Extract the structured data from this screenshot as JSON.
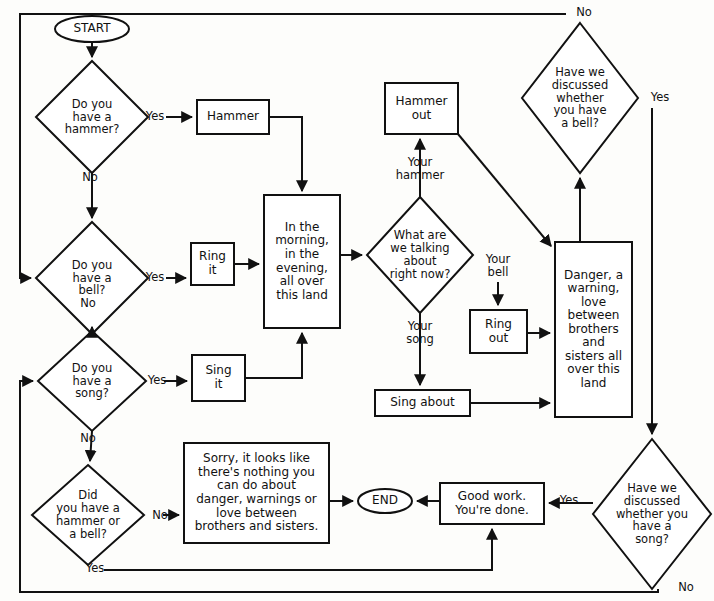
{
  "diagram": {
    "style": {
      "stroke": "#111111",
      "fill": "#ffffff",
      "background": "#fdfdfb",
      "stroke_width": 2
    },
    "nodes": [
      {
        "id": "start",
        "shape": "terminator",
        "text": "START",
        "cx": 92,
        "cy": 29,
        "w": 74,
        "h": 26,
        "font": "n-term"
      },
      {
        "id": "q-hammer",
        "shape": "decision",
        "text": "Do you\nhave a\nhammer?",
        "cx": 92,
        "cy": 117,
        "w": 112,
        "h": 112,
        "font": "n-dec"
      },
      {
        "id": "q-bell",
        "shape": "decision",
        "text": "Do you\nhave a\nbell?",
        "cx": 92,
        "cy": 278,
        "w": 112,
        "h": 112,
        "font": "n-dec"
      },
      {
        "id": "q-song",
        "shape": "decision",
        "text": "Do you\nhave a\nsong?",
        "cx": 92,
        "cy": 381,
        "w": 108,
        "h": 100,
        "font": "n-dec"
      },
      {
        "id": "q-had-hammer-bell",
        "shape": "decision",
        "text": "Did\nyou have a\nhammer or\na bell?",
        "cx": 88,
        "cy": 515,
        "w": 112,
        "h": 100,
        "font": "n-dec"
      },
      {
        "id": "p-hammer",
        "shape": "process",
        "text": "Hammer",
        "x": 197,
        "y": 100,
        "w": 72,
        "h": 34,
        "font": "n-proc"
      },
      {
        "id": "p-ring-it",
        "shape": "process",
        "text": "Ring\nit",
        "x": 191,
        "y": 243,
        "w": 43,
        "h": 42,
        "font": "n-proc"
      },
      {
        "id": "p-sing-it",
        "shape": "process",
        "text": "Sing\nit",
        "x": 192,
        "y": 355,
        "w": 53,
        "h": 46,
        "font": "n-proc"
      },
      {
        "id": "p-morning",
        "shape": "process",
        "text": "In the\nmorning,\nin the\nevening,\nall over\nthis land",
        "x": 264,
        "y": 195,
        "w": 76,
        "h": 133,
        "font": "n-proc"
      },
      {
        "id": "p-hammer-out",
        "shape": "process",
        "text": "Hammer\nout",
        "x": 385,
        "y": 83,
        "w": 73,
        "h": 51,
        "font": "n-proc"
      },
      {
        "id": "q-talking",
        "shape": "decision",
        "text": "What are\nwe talking\nabout\nright now?",
        "cx": 420,
        "cy": 255,
        "w": 106,
        "h": 116,
        "font": "n-dec"
      },
      {
        "id": "p-ring-out",
        "shape": "process",
        "text": "Ring\nout",
        "x": 470,
        "y": 310,
        "w": 57,
        "h": 43,
        "font": "n-proc"
      },
      {
        "id": "p-sing-about",
        "shape": "process",
        "text": "Sing about",
        "x": 375,
        "y": 390,
        "w": 95,
        "h": 26,
        "font": "n-proc"
      },
      {
        "id": "p-danger",
        "shape": "process",
        "text": "Danger, a\nwarning,\nlove\nbetween\nbrothers\nand\nsisters all\nover this\nland",
        "x": 555,
        "y": 242,
        "w": 77,
        "h": 175,
        "font": "n-proc"
      },
      {
        "id": "q-disc-bell",
        "shape": "decision",
        "text": "Have we\ndiscussed\nwhether\nyou have\na bell?",
        "cx": 580,
        "cy": 98,
        "w": 116,
        "h": 150,
        "font": "n-dec"
      },
      {
        "id": "q-disc-song",
        "shape": "decision",
        "text": "Have we\ndiscussed\nwhether you\nhave a\nsong?",
        "cx": 652,
        "cy": 514,
        "w": 118,
        "h": 150,
        "font": "n-dec"
      },
      {
        "id": "p-sorry",
        "shape": "process",
        "text": "Sorry, it looks like\nthere's nothing you\ncan do about\ndanger, warnings or\nlove between\nbrothers and sisters.",
        "x": 184,
        "y": 443,
        "w": 145,
        "h": 100,
        "font": "n-proc"
      },
      {
        "id": "p-good-work",
        "shape": "process",
        "text": "Good work.\nYou're done.",
        "x": 440,
        "y": 483,
        "w": 104,
        "h": 41,
        "font": "n-proc"
      },
      {
        "id": "end",
        "shape": "terminator",
        "text": "END",
        "cx": 385,
        "cy": 501,
        "w": 54,
        "h": 24,
        "font": "n-term"
      }
    ],
    "edge_labels": [
      {
        "id": "lbl-hammer-yes",
        "text": "Yes",
        "x": 140,
        "y": 110,
        "w": 30
      },
      {
        "id": "lbl-hammer-no",
        "text": "No",
        "x": 76,
        "y": 171,
        "w": 28
      },
      {
        "id": "lbl-bell-yes",
        "text": "Yes",
        "x": 140,
        "y": 271,
        "w": 30
      },
      {
        "id": "lbl-bell-no",
        "text": "No",
        "x": 74,
        "y": 297,
        "w": 28
      },
      {
        "id": "lbl-song-yes",
        "text": "Yes",
        "x": 142,
        "y": 374,
        "w": 30
      },
      {
        "id": "lbl-song-no",
        "text": "No",
        "x": 74,
        "y": 432,
        "w": 28
      },
      {
        "id": "lbl-had-no",
        "text": "No",
        "x": 146,
        "y": 509,
        "w": 28
      },
      {
        "id": "lbl-had-yes",
        "text": "Yes",
        "x": 80,
        "y": 564,
        "w": 30
      },
      {
        "id": "lbl-your-hammer",
        "text": "Your\nhammer",
        "x": 393,
        "y": 156,
        "w": 60
      },
      {
        "id": "lbl-your-bell",
        "text": "Your\nbell",
        "x": 477,
        "y": 253,
        "w": 44
      },
      {
        "id": "lbl-your-song",
        "text": "Your\nsong",
        "x": 398,
        "y": 322,
        "w": 44
      },
      {
        "id": "lbl-disc-bell-no",
        "text": "No",
        "x": 580,
        "y": 5,
        "w": 28
      },
      {
        "id": "lbl-disc-bell-yes",
        "text": "Yes",
        "x": 645,
        "y": 91,
        "w": 30
      },
      {
        "id": "lbl-disc-song-yes",
        "text": "Yes",
        "x": 556,
        "y": 492,
        "w": 30
      },
      {
        "id": "lbl-disc-song-no",
        "text": "No",
        "x": 671,
        "y": 580,
        "w": 28
      }
    ],
    "flow": {
      "description": "Decision flowchart about having a hammer, a bell, or a song (If I Had a Hammer).",
      "steps": [
        "START leads to 'Do you have a hammer?'",
        "Yes -> Hammer -> 'In the morning, in the evening, all over this land'",
        "No -> 'Do you have a bell?'; Yes -> Ring it -> morning box; No -> 'Do you have a song?'",
        "Yes -> Sing it -> morning box; No -> 'Did you have a hammer or a bell?'",
        "Morning box -> 'What are we talking about right now?'",
        "Your hammer -> Hammer out -> Danger box",
        "Your bell -> Ring out -> Danger box",
        "Your song -> Sing about -> Danger box",
        "Danger box -> 'Have we discussed whether you have a bell?'",
        "No -> back to 'Do you have a bell?'; Yes -> 'Have we discussed whether you have a song?'",
        "Yes -> 'Good work. You're done.' -> END",
        "No -> back to 'Do you have a song?'",
        "'Did you have a hammer or a bell?' No -> Sorry box -> END; Yes -> loops back to Good work"
      ]
    }
  }
}
